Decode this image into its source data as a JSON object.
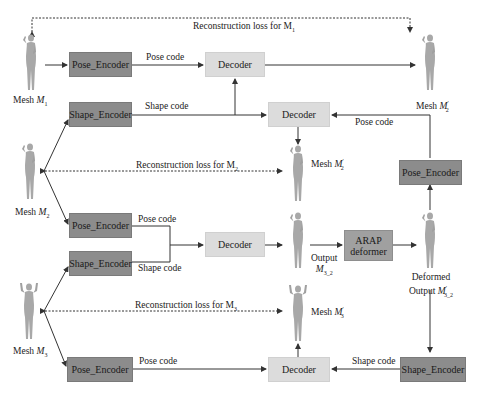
{
  "diagram": {
    "nodes": {
      "pose_encoder_1": "Pose_Encoder",
      "shape_encoder_1": "Shape_Encoder",
      "decoder_1": "Decoder",
      "decoder_2": "Decoder",
      "pose_encoder_right": "Pose_Encoder",
      "pose_encoder_2": "Pose_Encoder",
      "shape_encoder_2": "Shape_Encoder",
      "decoder_3": "Decoder",
      "arap_line1": "ARAP",
      "arap_line2": "deformer",
      "pose_encoder_3": "Pose_Encoder",
      "decoder_4": "Decoder",
      "shape_encoder_right": "Shape_Encoder"
    },
    "edge_labels": {
      "pose_code_1": "Pose code",
      "shape_code_1": "Shape code",
      "pose_code_right": "Pose code",
      "pose_code_2": "Pose code",
      "shape_code_2": "Shape code",
      "pose_code_3": "Pose code",
      "shape_code_right": "Shape code"
    },
    "losses": {
      "m1": "Reconstruction loss for M",
      "m1_sub": "1",
      "m2": "Reconstruction loss for M",
      "m2_sub": "2",
      "m3": "Reconstruction loss for M",
      "m3_sub": "3"
    },
    "meshes": {
      "m1": {
        "prefix": "Mesh ",
        "var": "M",
        "sub": "1"
      },
      "m2": {
        "prefix": "Mesh ",
        "var": "M",
        "sub": "2"
      },
      "m3": {
        "prefix": "Mesh ",
        "var": "M",
        "sub": "3"
      },
      "m2_prime_top": {
        "prefix": "Mesh ",
        "var": "M",
        "sup": "′",
        "sub": "2"
      },
      "m2_prime_mid": {
        "prefix": "Mesh ",
        "var": "M",
        "sup": "′",
        "sub": "2"
      },
      "m3_prime": {
        "prefix": "Mesh ",
        "var": "M",
        "sup": "′",
        "sub": "3"
      },
      "output": {
        "line1": "Output",
        "var": "M",
        "sub": "3_2"
      },
      "deformed": {
        "line1": "Deformed",
        "line2": "Output ",
        "var": "M",
        "sup": "′",
        "sub": "3_2"
      }
    },
    "colors": {
      "encoder": "#8c8c8c",
      "decoder": "#dcdcdc",
      "arap": "#a0a0a0",
      "mesh": "#a8a8a8",
      "line": "#333333"
    }
  }
}
